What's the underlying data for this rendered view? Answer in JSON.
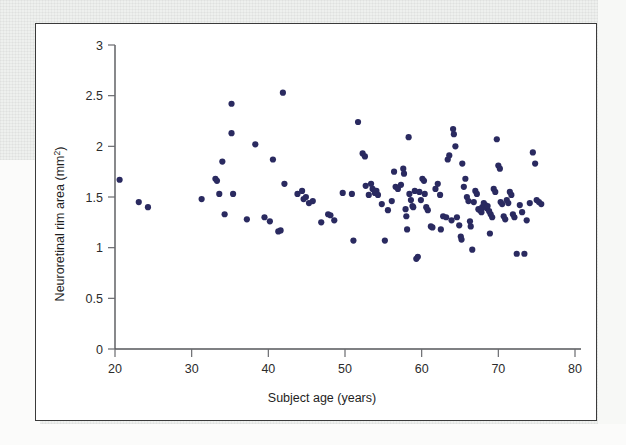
{
  "figure": {
    "background_color": "#ffffff",
    "border_color": "#3a3a3a",
    "page_background_color": "#eef0ee"
  },
  "chart_data": {
    "type": "scatter",
    "title": "",
    "xlabel": "Subject age (years)",
    "ylabel": "Neuroretinal rim area (mm²)",
    "ylabel_main": "Neuroretinal rim area (mm",
    "ylabel_sup": "2",
    "ylabel_tail": ")",
    "xlim": [
      20,
      80
    ],
    "ylim": [
      0,
      3
    ],
    "xticks": [
      20,
      30,
      40,
      50,
      60,
      70,
      80
    ],
    "yticks": [
      0,
      0.5,
      1,
      1.5,
      2,
      2.5,
      3
    ],
    "xtick_labels": [
      "20",
      "30",
      "40",
      "50",
      "60",
      "70",
      "80"
    ],
    "ytick_labels": [
      "0",
      "0.5",
      "1",
      "1.5",
      "2",
      "2.5",
      "3"
    ],
    "grid": false,
    "legend": null,
    "marker_color": "#2a2a60",
    "marker_size": 3.1,
    "n_points": 137,
    "points": [
      [
        20.6,
        1.67
      ],
      [
        23.1,
        1.45
      ],
      [
        24.3,
        1.4
      ],
      [
        31.3,
        1.48
      ],
      [
        33.1,
        1.68
      ],
      [
        33.3,
        1.66
      ],
      [
        33.6,
        1.53
      ],
      [
        34.0,
        1.85
      ],
      [
        34.3,
        1.33
      ],
      [
        35.2,
        2.42
      ],
      [
        35.2,
        2.13
      ],
      [
        35.4,
        1.53
      ],
      [
        37.2,
        1.28
      ],
      [
        38.3,
        2.02
      ],
      [
        39.5,
        1.3
      ],
      [
        40.2,
        1.26
      ],
      [
        40.6,
        1.87
      ],
      [
        41.3,
        1.16
      ],
      [
        41.6,
        1.17
      ],
      [
        41.9,
        2.53
      ],
      [
        42.1,
        1.63
      ],
      [
        43.8,
        1.53
      ],
      [
        44.4,
        1.56
      ],
      [
        44.6,
        1.48
      ],
      [
        44.9,
        1.5
      ],
      [
        45.3,
        1.44
      ],
      [
        45.8,
        1.46
      ],
      [
        46.9,
        1.25
      ],
      [
        47.8,
        1.33
      ],
      [
        48.1,
        1.32
      ],
      [
        49.7,
        1.54
      ],
      [
        51.1,
        1.07
      ],
      [
        51.7,
        2.24
      ],
      [
        52.3,
        1.93
      ],
      [
        52.6,
        1.9
      ],
      [
        52.7,
        1.61
      ],
      [
        53.1,
        1.52
      ],
      [
        53.6,
        1.58
      ],
      [
        53.9,
        1.54
      ],
      [
        54.1,
        1.56
      ],
      [
        54.3,
        1.52
      ],
      [
        54.8,
        1.43
      ],
      [
        55.2,
        1.07
      ],
      [
        55.6,
        1.37
      ],
      [
        56.4,
        1.75
      ],
      [
        56.6,
        1.6
      ],
      [
        56.9,
        1.58
      ],
      [
        57.3,
        1.62
      ],
      [
        57.6,
        1.78
      ],
      [
        57.7,
        1.73
      ],
      [
        57.9,
        1.38
      ],
      [
        58.0,
        1.31
      ],
      [
        58.1,
        1.18
      ],
      [
        58.3,
        2.09
      ],
      [
        58.4,
        1.53
      ],
      [
        58.6,
        1.47
      ],
      [
        58.8,
        1.41
      ],
      [
        58.9,
        1.4
      ],
      [
        59.1,
        1.56
      ],
      [
        59.3,
        0.89
      ],
      [
        59.5,
        0.91
      ],
      [
        59.7,
        1.55
      ],
      [
        59.9,
        1.47
      ],
      [
        60.1,
        1.68
      ],
      [
        60.3,
        1.66
      ],
      [
        60.4,
        1.53
      ],
      [
        60.6,
        1.4
      ],
      [
        60.8,
        1.37
      ],
      [
        61.2,
        1.21
      ],
      [
        61.4,
        1.2
      ],
      [
        61.8,
        1.58
      ],
      [
        62.1,
        1.63
      ],
      [
        62.4,
        1.52
      ],
      [
        62.8,
        1.31
      ],
      [
        63.2,
        1.3
      ],
      [
        63.4,
        1.87
      ],
      [
        63.6,
        1.91
      ],
      [
        63.9,
        1.27
      ],
      [
        64.1,
        2.17
      ],
      [
        64.2,
        2.12
      ],
      [
        64.4,
        2.0
      ],
      [
        64.6,
        1.3
      ],
      [
        64.9,
        1.22
      ],
      [
        65.1,
        1.11
      ],
      [
        65.2,
        1.08
      ],
      [
        65.3,
        1.83
      ],
      [
        65.5,
        1.6
      ],
      [
        65.7,
        1.68
      ],
      [
        65.9,
        1.5
      ],
      [
        66.1,
        1.46
      ],
      [
        66.3,
        1.26
      ],
      [
        66.4,
        1.21
      ],
      [
        66.6,
        0.98
      ],
      [
        66.8,
        1.45
      ],
      [
        67.0,
        1.56
      ],
      [
        67.2,
        1.53
      ],
      [
        67.4,
        1.38
      ],
      [
        67.6,
        1.37
      ],
      [
        67.8,
        1.35
      ],
      [
        67.9,
        1.4
      ],
      [
        68.1,
        1.44
      ],
      [
        68.3,
        1.42
      ],
      [
        68.5,
        1.39
      ],
      [
        68.6,
        1.41
      ],
      [
        68.8,
        1.36
      ],
      [
        69.0,
        1.33
      ],
      [
        69.2,
        1.3
      ],
      [
        69.4,
        1.58
      ],
      [
        69.6,
        1.55
      ],
      [
        69.8,
        2.07
      ],
      [
        70.0,
        1.81
      ],
      [
        70.2,
        1.78
      ],
      [
        70.3,
        1.45
      ],
      [
        70.5,
        1.43
      ],
      [
        70.7,
        1.31
      ],
      [
        70.9,
        1.28
      ],
      [
        71.1,
        1.47
      ],
      [
        71.3,
        1.44
      ],
      [
        71.5,
        1.55
      ],
      [
        71.7,
        1.52
      ],
      [
        71.9,
        1.33
      ],
      [
        72.1,
        1.3
      ],
      [
        72.4,
        0.94
      ],
      [
        72.8,
        1.42
      ],
      [
        73.1,
        1.35
      ],
      [
        73.4,
        0.94
      ],
      [
        73.7,
        1.27
      ],
      [
        74.1,
        1.44
      ],
      [
        74.5,
        1.94
      ],
      [
        74.8,
        1.83
      ],
      [
        75.0,
        1.47
      ],
      [
        75.3,
        1.45
      ],
      [
        75.6,
        1.43
      ],
      [
        68.9,
        1.14
      ],
      [
        62.5,
        1.18
      ],
      [
        56.1,
        1.46
      ],
      [
        53.4,
        1.63
      ],
      [
        50.9,
        1.53
      ],
      [
        48.6,
        1.27
      ]
    ]
  }
}
